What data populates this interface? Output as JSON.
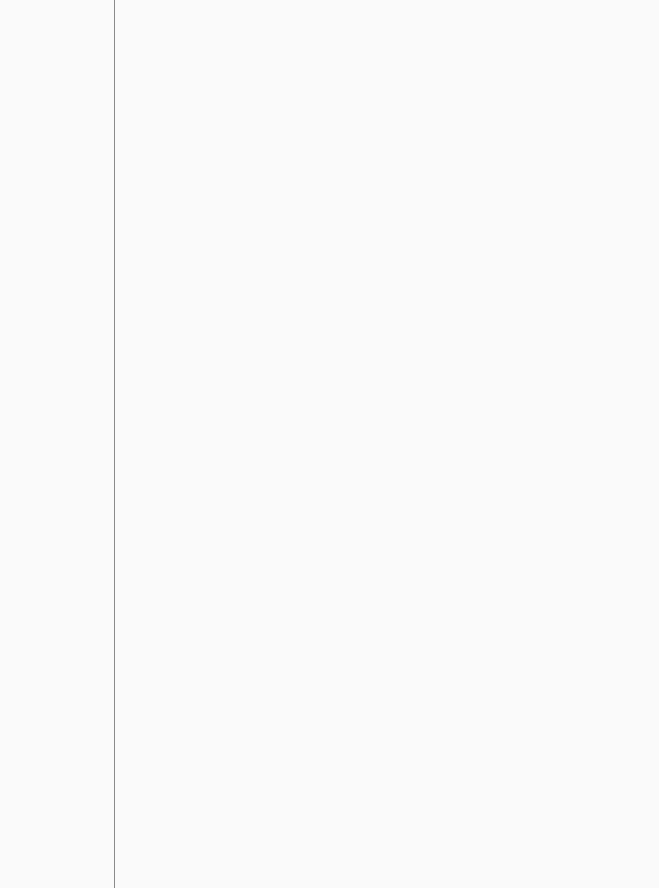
{
  "paper": {
    "type": "lined notebook paper",
    "ruled_line_count": 32,
    "has_margin_line": true,
    "colors": {
      "paper": "#fafafa",
      "rule": "#9a9a9a",
      "margin": "#8a8a8a"
    }
  }
}
